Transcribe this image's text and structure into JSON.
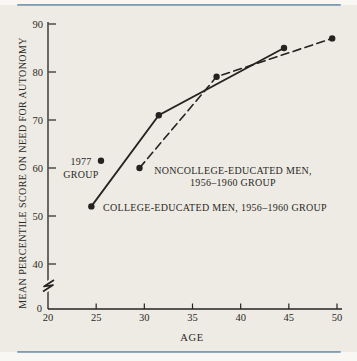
{
  "figure": {
    "xlabel": "AGE",
    "ylabel": "MEAN PERCENTILE SCORE ON NEED FOR AUTONOMY",
    "annotations": {
      "group_1977_line1": "1977",
      "group_1977_line2": "GROUP",
      "noncollege_line1": "NONCOLLEGE-EDUCATED MEN,",
      "noncollege_line2": "1956–1960 GROUP",
      "college": "COLLEGE-EDUCATED MEN, 1956–1960 GROUP"
    },
    "colors": {
      "ink": "#24231f",
      "paper": "#eeebe4",
      "page": "#f8f7f3",
      "rule_blue": "#7b94ab"
    }
  },
  "chart_data": {
    "type": "line",
    "title": "",
    "xlabel": "AGE",
    "ylabel": "MEAN PERCENTILE SCORE ON NEED FOR AUTONOMY",
    "xlim": [
      20,
      50
    ],
    "ylim": [
      40,
      90
    ],
    "y_axis_break": true,
    "y_origin_label": "0",
    "x_ticks": [
      20,
      25,
      30,
      35,
      40,
      45,
      50
    ],
    "y_ticks": [
      40,
      50,
      60,
      70,
      80,
      90
    ],
    "grid": false,
    "legend": "inline-annotations",
    "series": [
      {
        "name": "COLLEGE-EDUCATED MEN, 1956–1960 GROUP",
        "line_style": "solid",
        "marker": "dot",
        "points": [
          [
            24.5,
            52
          ],
          [
            31.5,
            71
          ],
          [
            44.5,
            85
          ]
        ]
      },
      {
        "name": "NONCOLLEGE-EDUCATED MEN, 1956–1960 GROUP",
        "line_style": "dashed",
        "marker": "dot",
        "points": [
          [
            29.5,
            60
          ],
          [
            37.5,
            79
          ],
          [
            49.5,
            87
          ]
        ]
      },
      {
        "name": "1977 GROUP",
        "line_style": "none",
        "marker": "dot",
        "points": [
          [
            25.5,
            61.5
          ]
        ]
      }
    ]
  }
}
